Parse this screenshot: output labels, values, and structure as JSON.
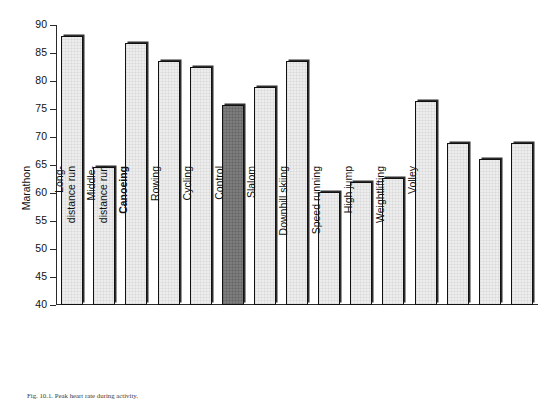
{
  "chart_data": {
    "type": "bar",
    "title": "",
    "xlabel": "",
    "ylabel": "LV volume · BSA (ml·m−2)",
    "ylabel_prefix": "LV volume · BSA (ml·m",
    "ylabel_exponent": "−2",
    "ylabel_suffix": ")",
    "ylim": [
      40,
      90
    ],
    "ytick_step": 5,
    "yticks": [
      90,
      85,
      80,
      75,
      70,
      65,
      60,
      55,
      50,
      45,
      40
    ],
    "grid": false,
    "legend": "none",
    "categories": [
      "Cross-country\nskiing",
      "Walking",
      "Marathon",
      "Long-\ndistance run",
      "Middle-\ndistance run",
      "Canoeing",
      "Rowing",
      "Cycling",
      "Control",
      "Slalom",
      "Downhill skiing",
      "Speed running",
      "High jump",
      "Weightlifting",
      "Volley"
    ],
    "values": [
      88.1,
      64.7,
      86.8,
      83.5,
      82.5,
      75.8,
      78.9,
      83.6,
      60.2,
      62.0,
      62.6,
      76.5,
      68.9,
      66.0,
      68.9
    ],
    "highlight_index": 5,
    "highlight_label": "Canoeing",
    "bar_color": "#ededed",
    "bar_highlight_color": "#7d7d7d",
    "bar_edge_color": "#111111"
  },
  "caption": {
    "text": "Fig. 10.1. Peak heart rate during activity."
  }
}
